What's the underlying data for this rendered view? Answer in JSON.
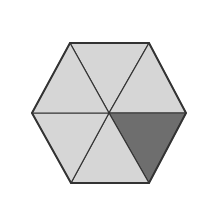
{
  "diagram": {
    "title": "",
    "shape": "regular hexagon divided into 6 equal triangles",
    "total_parts": 6,
    "shaded_parts": 1,
    "colors": {
      "background": "#ffffff",
      "light_fill": "#d6d6d6",
      "shaded_fill": "#6e6e6e",
      "stroke": "#333333"
    },
    "center": [
      109,
      113
    ],
    "vertices": [
      [
        70,
        43
      ],
      [
        149,
        43
      ],
      [
        186,
        113
      ],
      [
        149,
        183
      ],
      [
        71,
        183
      ],
      [
        32,
        113
      ]
    ],
    "triangles": [
      {
        "id": "top",
        "shaded": false
      },
      {
        "id": "upper-right",
        "shaded": false
      },
      {
        "id": "lower-right",
        "shaded": true
      },
      {
        "id": "bottom",
        "shaded": false
      },
      {
        "id": "lower-left",
        "shaded": false
      },
      {
        "id": "upper-left",
        "shaded": false
      }
    ]
  }
}
